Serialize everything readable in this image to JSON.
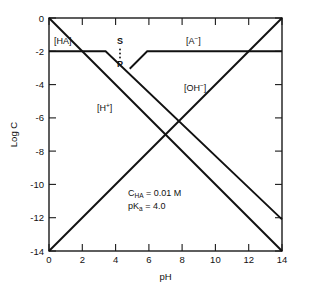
{
  "chart_data": {
    "type": "line",
    "title": "",
    "xlabel": "pH",
    "ylabel": "Log C",
    "xlim": [
      0,
      14
    ],
    "ylim": [
      -14,
      0
    ],
    "xticks": [
      0,
      2,
      4,
      6,
      8,
      10,
      12,
      14
    ],
    "yticks": [
      0,
      -2,
      -4,
      -6,
      -8,
      -10,
      -12,
      -14
    ],
    "xtick_labels": [
      "0",
      "2",
      "4",
      "6",
      "8",
      "10",
      "12",
      "14"
    ],
    "ytick_labels": [
      "0",
      "-2",
      "-4",
      "-6",
      "-8",
      "-10",
      "-12",
      "-14"
    ],
    "grid": false,
    "legend": "inline-annotations",
    "series": [
      {
        "name": "H+",
        "label": "[H⁺]",
        "points": [
          [
            0,
            0
          ],
          [
            14,
            -14
          ]
        ]
      },
      {
        "name": "OH-",
        "label": "[OH⁻]",
        "points": [
          [
            0,
            -14
          ],
          [
            14,
            0
          ]
        ]
      },
      {
        "name": "HA",
        "label": "[HA]",
        "points": [
          [
            0,
            -2
          ],
          [
            3.4,
            -2
          ],
          [
            14,
            -12.1
          ]
        ]
      },
      {
        "name": "A-",
        "label": "[A⁻]",
        "points": [
          [
            4.85,
            -3.05
          ],
          [
            5.9,
            -2
          ],
          [
            14,
            -2
          ]
        ]
      }
    ],
    "annotations": [
      {
        "name": "ha-label",
        "text": "[HA]",
        "x": 0.35,
        "y": -1.45
      },
      {
        "name": "a-minus-label",
        "text": "[A⁻]",
        "x": 9.1,
        "y": -1.45
      },
      {
        "name": "oh-minus-label",
        "text": "[OH⁻]",
        "x": 8.6,
        "y": -4.3
      },
      {
        "name": "h-plus-label",
        "text": "[H⁺]",
        "x": 4.0,
        "y": -5.5
      },
      {
        "name": "system-point-s",
        "text": "S",
        "x": 4.25,
        "y": -1.45
      },
      {
        "name": "system-point-p",
        "text": "P",
        "x": 4.25,
        "y": -3.1
      }
    ],
    "parameters": {
      "c_ha_line": "C_HA = 0.01 M",
      "c_ha_symbol": "C",
      "c_ha_subscript": "HA",
      "c_ha_value": "= 0.01 M",
      "pka_symbol": "pK",
      "pka_subscript": "a",
      "pka_value": "= 4.0",
      "pka_line": "pKa = 4.0"
    },
    "colors": {
      "line": "#111111",
      "axis": "#1a1a1a",
      "background": "#ffffff"
    }
  }
}
